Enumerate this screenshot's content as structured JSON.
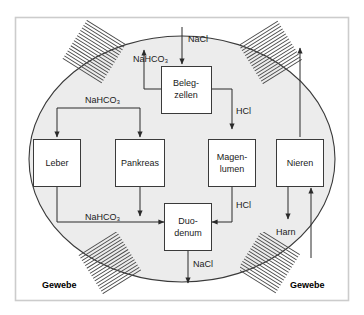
{
  "figure": {
    "background_color": "#ffffff",
    "frame_color": "#cccccc",
    "body_fill": "#ececec",
    "body_stroke": "#3a3a3a",
    "line_color": "#2a2a2a"
  },
  "nodes": [
    {
      "id": "belegzellen",
      "line1": "Beleg-",
      "line2": "zellen"
    },
    {
      "id": "leber",
      "line1": "Leber",
      "line2": ""
    },
    {
      "id": "pankreas",
      "line1": "Pankreas",
      "line2": ""
    },
    {
      "id": "magenlumen",
      "line1": "Magen-",
      "line2": "lumen"
    },
    {
      "id": "nieren",
      "line1": "Nieren",
      "line2": ""
    },
    {
      "id": "duodenum",
      "line1": "Duo-",
      "line2": "denum"
    }
  ],
  "edge_labels": {
    "nacl_top": "NaCl",
    "nahco3_top_left": "NaHCO₃",
    "nahco3_mid_left": "NaHCO₃",
    "nahco3_bottom": "NaHCO₃",
    "hcl_upper": "HCl",
    "hcl_lower": "HCl",
    "harn": "Harn",
    "nacl_bottom": "NaCl"
  },
  "tissue_labels": {
    "left": "Gewebe",
    "right": "Gewebe"
  }
}
